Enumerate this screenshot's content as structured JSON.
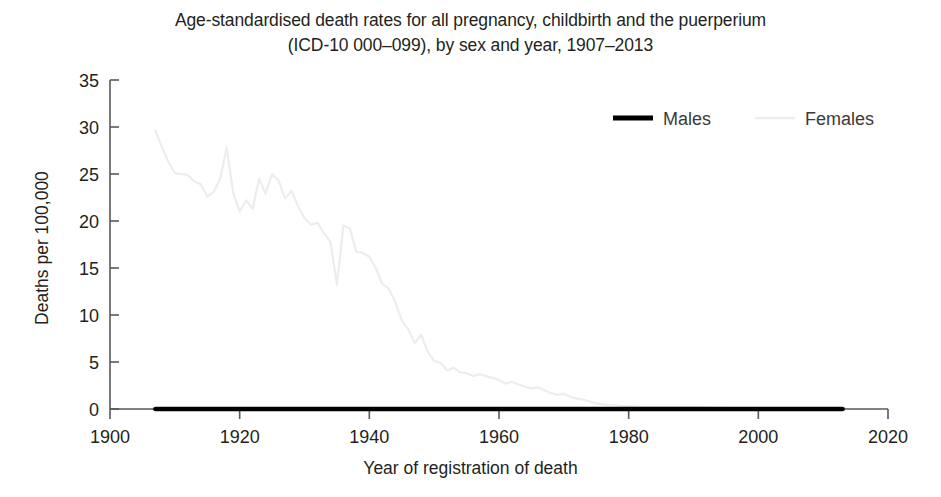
{
  "chart_data": {
    "type": "line",
    "title": "Age-standardised death rates for all pregnancy, childbirth and the puerperium (ICD-10 000–099), by sex and year, 1907–2013",
    "title_line1": "Age-standardised death rates for all pregnancy, childbirth and the puerperium",
    "title_line2": "(ICD-10 000–099), by sex and year, 1907–2013",
    "xlabel": "Year of registration of death",
    "ylabel": "Deaths per 100,000",
    "xlim": [
      1900,
      2020
    ],
    "ylim": [
      0,
      35
    ],
    "xticks": [
      1900,
      1920,
      1940,
      1960,
      1980,
      2000,
      2020
    ],
    "xtick_labels": [
      "1900",
      "1920",
      "1940",
      "1960",
      "1980",
      "2000",
      "2020"
    ],
    "yticks": [
      0,
      5,
      10,
      15,
      20,
      25,
      30,
      35
    ],
    "ytick_labels": [
      "0",
      "5",
      "10",
      "15",
      "20",
      "25",
      "30",
      "35"
    ],
    "grid": false,
    "legend_position": "top-right",
    "series": [
      {
        "name": "Males",
        "color": "#000000",
        "linewidth": 4.5,
        "x": [
          1907,
          1910,
          1913,
          1916,
          1919,
          1922,
          1925,
          1928,
          1931,
          1934,
          1937,
          1940,
          1943,
          1946,
          1949,
          1952,
          1955,
          1958,
          1961,
          1964,
          1967,
          1970,
          1973,
          1976,
          1979,
          1982,
          1985,
          1988,
          1991,
          1994,
          1997,
          2000,
          2003,
          2006,
          2009,
          2013
        ],
        "values": [
          0,
          0,
          0,
          0,
          0,
          0,
          0,
          0,
          0,
          0,
          0,
          0,
          0,
          0,
          0,
          0,
          0,
          0,
          0,
          0,
          0,
          0,
          0,
          0,
          0,
          0,
          0,
          0,
          0,
          0,
          0,
          0,
          0,
          0,
          0,
          0
        ]
      },
      {
        "name": "Females",
        "color": "#ededed",
        "linewidth": 2.2,
        "x": [
          1907,
          1908,
          1909,
          1910,
          1911,
          1912,
          1913,
          1914,
          1915,
          1916,
          1917,
          1918,
          1919,
          1920,
          1921,
          1922,
          1923,
          1924,
          1925,
          1926,
          1927,
          1928,
          1929,
          1930,
          1931,
          1932,
          1933,
          1934,
          1935,
          1936,
          1937,
          1938,
          1939,
          1940,
          1941,
          1942,
          1943,
          1944,
          1945,
          1946,
          1947,
          1948,
          1949,
          1950,
          1951,
          1952,
          1953,
          1954,
          1955,
          1956,
          1957,
          1958,
          1959,
          1960,
          1961,
          1962,
          1963,
          1964,
          1965,
          1966,
          1967,
          1968,
          1969,
          1970,
          1971,
          1972,
          1973,
          1974,
          1975,
          1976,
          1977,
          1978,
          1979,
          1980,
          1982,
          1985,
          1990,
          1995,
          2000,
          2005,
          2010,
          2013
        ],
        "values": [
          29.6,
          27.9,
          26.3,
          25.1,
          25.0,
          24.9,
          24.2,
          23.9,
          22.6,
          23.1,
          24.5,
          27.8,
          23.0,
          21.0,
          22.2,
          21.3,
          24.5,
          22.9,
          25.0,
          24.3,
          22.4,
          23.2,
          21.6,
          20.3,
          19.6,
          19.8,
          18.7,
          17.8,
          13.2,
          19.5,
          19.2,
          16.7,
          16.6,
          16.2,
          15.0,
          13.3,
          12.8,
          11.4,
          9.4,
          8.5,
          7.0,
          7.9,
          6.1,
          5.1,
          4.9,
          4.1,
          4.4,
          3.9,
          3.8,
          3.5,
          3.7,
          3.5,
          3.3,
          3.1,
          2.7,
          2.9,
          2.6,
          2.4,
          2.2,
          2.3,
          2.0,
          1.7,
          1.5,
          1.6,
          1.3,
          1.1,
          1.0,
          0.8,
          0.6,
          0.5,
          0.4,
          0.4,
          0.3,
          0.3,
          0.2,
          0.2,
          0.2,
          0.1,
          0.1,
          0.1,
          0.1,
          0.1
        ]
      }
    ],
    "legend": [
      {
        "label": "Males",
        "color": "#000000"
      },
      {
        "label": "Females",
        "color": "#ededed"
      }
    ]
  },
  "geometry": {
    "x0_px": 110,
    "x1_px": 888,
    "x0_val": 1900,
    "x1_val": 2020,
    "y0_px": 409,
    "y1_px": 80,
    "y0_val": 0,
    "y1_val": 35
  }
}
